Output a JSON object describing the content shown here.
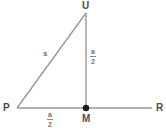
{
  "figure": {
    "type": "geometry-diagram",
    "background_color": "#ffffff",
    "line_color": "#999999",
    "point_color": "#1a1a1a",
    "label_color": "#4d4d4d",
    "width": 166,
    "height": 128
  },
  "points": {
    "P": {
      "label": "P",
      "x": 17,
      "y": 108
    },
    "U": {
      "label": "U",
      "x": 86,
      "y": 12
    },
    "M": {
      "label": "M",
      "x": 86,
      "y": 108
    },
    "R": {
      "label": "R",
      "x": 152,
      "y": 108
    }
  },
  "segments": {
    "hypotenuse": {
      "from": "P",
      "to": "U",
      "label": "s"
    },
    "vertical": {
      "from": "U",
      "to": "M",
      "numerator": "a",
      "denominator": "2"
    },
    "base_left": {
      "from": "P",
      "to": "M",
      "numerator": "a",
      "denominator": "2"
    },
    "base_line": {
      "from": "P",
      "to": "R"
    }
  },
  "labels": {
    "P": "P",
    "U": "U",
    "M": "M",
    "R": "R",
    "s": "s",
    "frac_numerator": "a",
    "frac_denominator": "2"
  }
}
